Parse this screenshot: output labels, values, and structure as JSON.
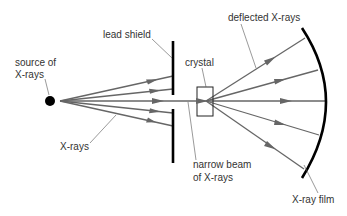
{
  "diagram": {
    "labels": {
      "source_line1": "source of",
      "source_line2": "X-rays",
      "lead_shield": "lead shield",
      "deflected": "deflected X-rays",
      "crystal": "crystal",
      "xrays": "X-rays",
      "narrow_line1": "narrow beam",
      "narrow_line2": "of X-rays",
      "film": "X-ray film"
    },
    "colors": {
      "ray": "#666666",
      "shield": "#000000",
      "text": "#333333"
    },
    "incident_ray_count": 5,
    "deflected_ray_count": 5
  }
}
